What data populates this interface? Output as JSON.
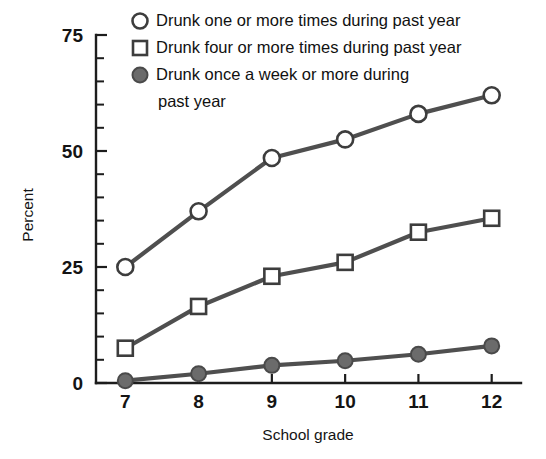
{
  "chart_data": {
    "type": "line",
    "title": "",
    "xlabel": "School grade",
    "ylabel": "Percent",
    "x": [
      7,
      8,
      9,
      10,
      11,
      12
    ],
    "categories": [
      "7",
      "8",
      "9",
      "10",
      "11",
      "12"
    ],
    "xlim": [
      6.6,
      12.4
    ],
    "ylim": [
      0,
      75
    ],
    "yticks": [
      0,
      25,
      50,
      75
    ],
    "ytick_labels": [
      "0",
      "25",
      "50",
      "75"
    ],
    "yminor_step": 5,
    "grid": false,
    "legend_position": "top-right-inside",
    "series": [
      {
        "name": "Drunk one or more times during past year",
        "marker": "open-circle",
        "values": [
          25,
          37,
          48.5,
          52.5,
          58,
          62
        ]
      },
      {
        "name": "Drunk four or more times during past year",
        "marker": "open-square",
        "values": [
          7.5,
          16.5,
          23,
          26,
          32.5,
          35.5
        ]
      },
      {
        "name": "Drunk once a week or more during past year",
        "marker": "filled-circle",
        "values": [
          0.5,
          2,
          3.8,
          4.8,
          6.2,
          8
        ]
      }
    ]
  },
  "legend": {
    "entries": [
      {
        "marker": "open-circle",
        "label": "Drunk one or more times during past year"
      },
      {
        "marker": "open-square",
        "label": "Drunk four or more times during past year"
      },
      {
        "marker": "filled-circle",
        "label": "Drunk once a week or more during"
      },
      {
        "marker": "none",
        "label": "past year"
      }
    ]
  },
  "colors": {
    "line": "#4f4f4f",
    "marker_fill": "#6b6b6b",
    "axis": "#1d1d1d",
    "text": "#141414",
    "background": "#ffffff"
  }
}
